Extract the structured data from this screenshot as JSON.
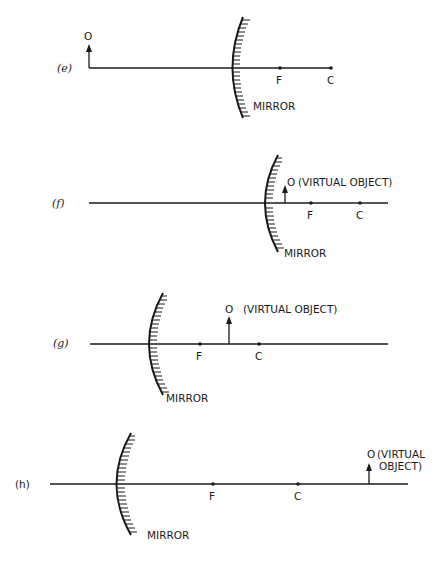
{
  "figure": {
    "panels": [
      {
        "id": "e",
        "label": "(e)",
        "mirror_label": "MIRROR",
        "object_label": "O",
        "focus_label": "F",
        "center_label": "C",
        "object_type": "real object beyond C (in front of mirror on left)"
      },
      {
        "id": "f",
        "label": "(f)",
        "mirror_label": "MIRROR",
        "object_label": "O",
        "object_note": "(VIRTUAL OBJECT)",
        "focus_label": "F",
        "center_label": "C",
        "object_type": "virtual object between mirror and F"
      },
      {
        "id": "g",
        "label": "(g)",
        "mirror_label": "MIRROR",
        "object_label": "O",
        "object_note": "(VIRTUAL OBJECT)",
        "focus_label": "F",
        "center_label": "C",
        "object_type": "virtual object between F and C"
      },
      {
        "id": "h",
        "label": "(h)",
        "mirror_label": "MIRROR",
        "object_label": "O",
        "object_note_line1": "(VIRTUAL",
        "object_note_line2": "OBJECT)",
        "focus_label": "F",
        "center_label": "C",
        "object_type": "virtual object beyond C"
      }
    ]
  }
}
